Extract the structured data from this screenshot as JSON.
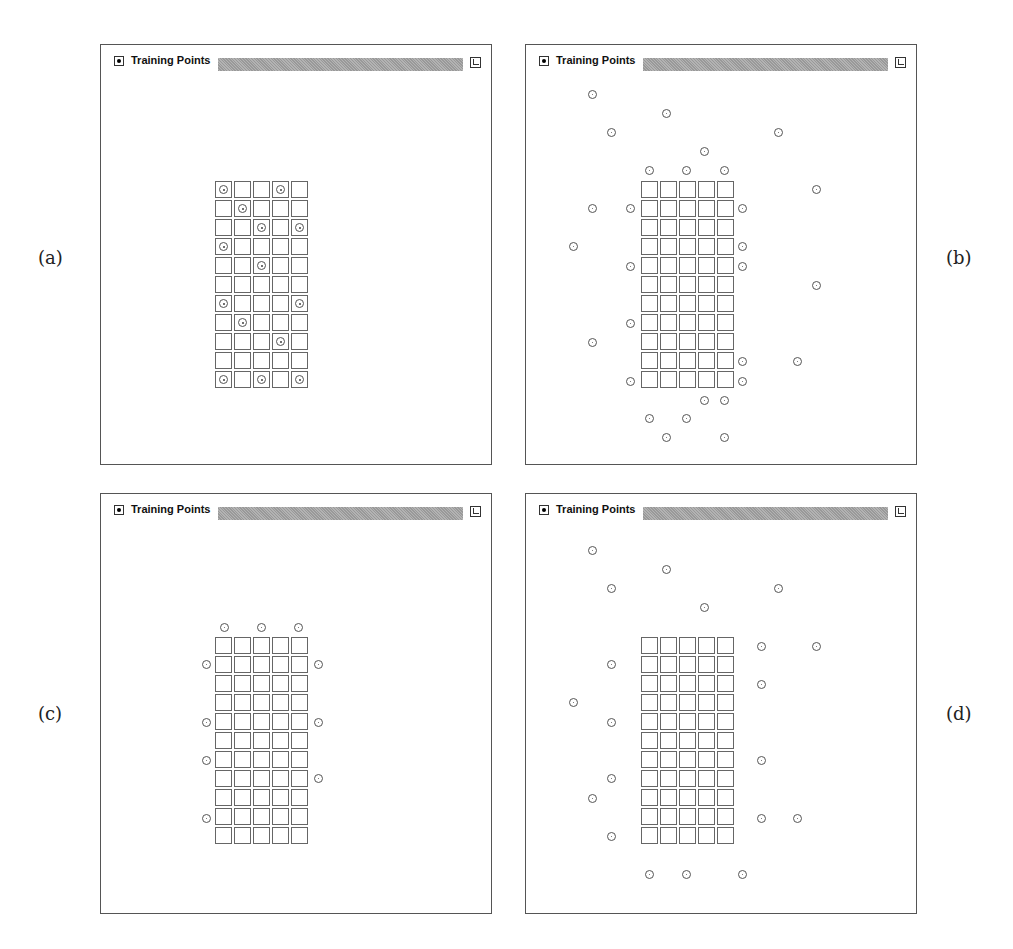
{
  "panels": [
    {
      "id": "a",
      "label": "(a)",
      "title": "Training Points",
      "box": {
        "left": 100,
        "top": 44
      },
      "label_pos": {
        "left": 38,
        "top": 247
      },
      "grid": {
        "left": 114,
        "top": 136,
        "cols": 5,
        "rows": 11,
        "pitch": 19,
        "cell": 17
      },
      "grid_points": [
        [
          0,
          0
        ],
        [
          0,
          3
        ],
        [
          1,
          1
        ],
        [
          2,
          2
        ],
        [
          2,
          4
        ],
        [
          3,
          0
        ],
        [
          4,
          2
        ],
        [
          6,
          0
        ],
        [
          6,
          4
        ],
        [
          7,
          1
        ],
        [
          8,
          3
        ],
        [
          10,
          0
        ],
        [
          10,
          2
        ],
        [
          10,
          4
        ]
      ],
      "outer_points": []
    },
    {
      "id": "b",
      "label": "(b)",
      "title": "Training Points",
      "box": {
        "left": 525,
        "top": 44
      },
      "label_pos": {
        "left": 946,
        "top": 247
      },
      "grid": {
        "left": 115,
        "top": 136,
        "cols": 5,
        "rows": 11,
        "pitch": 19,
        "cell": 17
      },
      "grid_points": [],
      "outer_points": [
        [
          66,
          49
        ],
        [
          140,
          68
        ],
        [
          85,
          87
        ],
        [
          252,
          87
        ],
        [
          178,
          106
        ],
        [
          123,
          125
        ],
        [
          160,
          125
        ],
        [
          198,
          125
        ],
        [
          290,
          144
        ],
        [
          66,
          163
        ],
        [
          104,
          163
        ],
        [
          216,
          163
        ],
        [
          47,
          201
        ],
        [
          216,
          201
        ],
        [
          104,
          221
        ],
        [
          216,
          221
        ],
        [
          290,
          240
        ],
        [
          104,
          278
        ],
        [
          66,
          297
        ],
        [
          216,
          316
        ],
        [
          271,
          316
        ],
        [
          104,
          336
        ],
        [
          216,
          336
        ],
        [
          178,
          355
        ],
        [
          198,
          355
        ],
        [
          123,
          373
        ],
        [
          160,
          373
        ],
        [
          140,
          392
        ],
        [
          198,
          392
        ]
      ]
    },
    {
      "id": "c",
      "label": "(c)",
      "title": "Training Points",
      "box": {
        "left": 100,
        "top": 493
      },
      "label_pos": {
        "left": 38,
        "top": 703
      },
      "grid": {
        "left": 114,
        "top": 143,
        "cols": 5,
        "rows": 11,
        "pitch": 19,
        "cell": 17
      },
      "grid_points": [],
      "outer_points": [
        [
          123,
          133
        ],
        [
          160,
          133
        ],
        [
          197,
          133
        ],
        [
          105,
          170
        ],
        [
          217,
          170
        ],
        [
          105,
          228
        ],
        [
          217,
          228
        ],
        [
          105,
          266
        ],
        [
          217,
          284
        ],
        [
          105,
          324
        ]
      ]
    },
    {
      "id": "d",
      "label": "(d)",
      "title": "Training Points",
      "box": {
        "left": 525,
        "top": 493
      },
      "label_pos": {
        "left": 946,
        "top": 703
      },
      "grid": {
        "left": 115,
        "top": 143,
        "cols": 5,
        "rows": 11,
        "pitch": 19,
        "cell": 17
      },
      "grid_points": [],
      "outer_points": [
        [
          66,
          56
        ],
        [
          140,
          75
        ],
        [
          85,
          94
        ],
        [
          252,
          94
        ],
        [
          178,
          113
        ],
        [
          235,
          152
        ],
        [
          290,
          152
        ],
        [
          85,
          170
        ],
        [
          235,
          190
        ],
        [
          47,
          208
        ],
        [
          85,
          228
        ],
        [
          235,
          266
        ],
        [
          85,
          284
        ],
        [
          66,
          304
        ],
        [
          235,
          324
        ],
        [
          271,
          324
        ],
        [
          85,
          342
        ],
        [
          123,
          380
        ],
        [
          160,
          380
        ],
        [
          216,
          380
        ]
      ]
    }
  ],
  "colors": {
    "border": "#555555",
    "bar": "#a8a8a8",
    "background": "#ffffff"
  }
}
